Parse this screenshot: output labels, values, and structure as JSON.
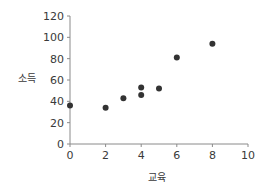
{
  "chart_data": {
    "type": "scatter",
    "title": "",
    "xlabel": "교육",
    "ylabel": "소득",
    "xlim": [
      0,
      10
    ],
    "ylim": [
      0,
      120
    ],
    "xticks": [
      0,
      2,
      4,
      6,
      8,
      10
    ],
    "yticks": [
      0,
      20,
      40,
      60,
      80,
      100,
      120
    ],
    "grid": false,
    "legend": null,
    "series": [
      {
        "name": "",
        "color": "#333333",
        "points": [
          {
            "x": 0,
            "y": 36
          },
          {
            "x": 2,
            "y": 34
          },
          {
            "x": 3,
            "y": 43
          },
          {
            "x": 4,
            "y": 46
          },
          {
            "x": 4,
            "y": 53
          },
          {
            "x": 5,
            "y": 52
          },
          {
            "x": 6,
            "y": 81
          },
          {
            "x": 8,
            "y": 94
          }
        ]
      }
    ]
  },
  "colors": {
    "axis": "#8a8a8a",
    "marker": "#333333",
    "text": "#3a3a3a"
  }
}
